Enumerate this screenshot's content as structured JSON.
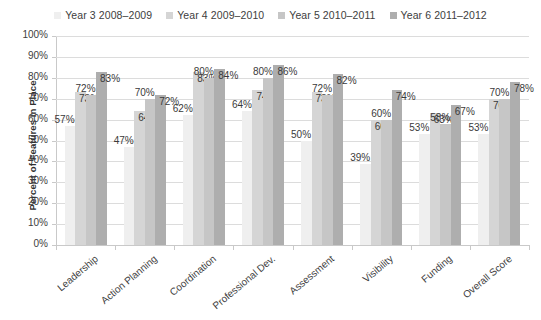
{
  "chart_data": {
    "type": "bar",
    "title": "",
    "xlabel": "",
    "ylabel": "Percent of Features In Place",
    "ylim": [
      0,
      100
    ],
    "ytick_labels": [
      "100%",
      "90%",
      "80%",
      "70%",
      "60%",
      "50%",
      "40%",
      "30%",
      "20%",
      "10%",
      "0%"
    ],
    "ytick_values": [
      100,
      90,
      80,
      70,
      60,
      50,
      40,
      30,
      20,
      10,
      0
    ],
    "grid": true,
    "legend_position": "top",
    "categories": [
      "Leadership",
      "Action Planning",
      "Coordination",
      "Professional Dev.",
      "Assessment",
      "Visibility",
      "Funding",
      "Overall Score"
    ],
    "series": [
      {
        "name": "Year 3 2008–2009",
        "color": "#efefef",
        "values": [
          57,
          47,
          62,
          64,
          50,
          39,
          53,
          53
        ],
        "labels": [
          "57%",
          "47%",
          "62%",
          "64%",
          "50%",
          "39%",
          "53%",
          "53%"
        ]
      },
      {
        "name": "Year 4 2009–2010",
        "color": "#d5d5d5",
        "values": [
          73,
          64,
          83,
          74,
          73,
          60,
          63,
          70
        ],
        "labels": [
          "73%",
          "64%",
          "83%",
          "74%",
          "73%",
          "60%",
          "63%",
          "70%"
        ]
      },
      {
        "name": "Year 5 2010–2011",
        "color": "#c6c6c6",
        "values": [
          72,
          70,
          80,
          80,
          72,
          60,
          58,
          70
        ],
        "labels": [
          "72%",
          "70%",
          "80%",
          "80%",
          "72%",
          "60%",
          "58%",
          "70%"
        ]
      },
      {
        "name": "Year 6 2011–2012",
        "color": "#aeaeae",
        "values": [
          83,
          72,
          84,
          86,
          82,
          74,
          67,
          78
        ],
        "labels": [
          "83%",
          "72%",
          "84%",
          "86%",
          "82%",
          "74%",
          "67%",
          "78%"
        ]
      }
    ]
  }
}
